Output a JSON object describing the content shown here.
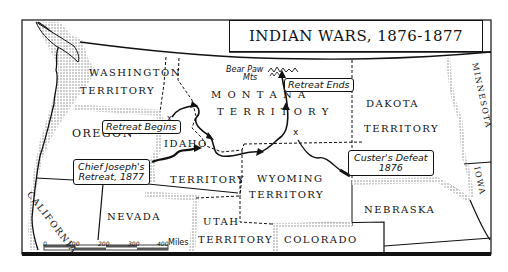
{
  "title": "INDIAN WARS, 1876-1877",
  "territories": [
    {
      "name": "WASHINGTON",
      "x": 89,
      "y": 71
    },
    {
      "name": "TERRITORY",
      "x": 80,
      "y": 89
    },
    {
      "name": "OREGON",
      "x": 72,
      "y": 131
    },
    {
      "name": "IDAHO",
      "x": 164,
      "y": 141
    },
    {
      "name": "TERRITORY",
      "x": 170,
      "y": 176
    },
    {
      "name": "M O N T A N A",
      "x": 211,
      "y": 91
    },
    {
      "name": "T E R R I T O R Y",
      "x": 217,
      "y": 108
    },
    {
      "name": "DAKOTA",
      "x": 366,
      "y": 100
    },
    {
      "name": "TERRITORY",
      "x": 364,
      "y": 125
    },
    {
      "name": "WYOMING",
      "x": 257,
      "y": 174
    },
    {
      "name": "TERRITORY",
      "x": 249,
      "y": 191
    },
    {
      "name": "NEVADA",
      "x": 107,
      "y": 214
    },
    {
      "name": "UTAH",
      "x": 203,
      "y": 218
    },
    {
      "name": "TERRITORY",
      "x": 198,
      "y": 236
    },
    {
      "name": "COLORADO",
      "x": 284,
      "y": 237
    },
    {
      "name": "NEBRASKA",
      "x": 364,
      "y": 207
    }
  ],
  "rotated_labels": [
    {
      "name": "CALIFORNIA",
      "x": 36,
      "y": 178,
      "rotate": 52
    },
    {
      "name": "MINNESOTA",
      "x": 456,
      "y": 72,
      "rotate": 78
    },
    {
      "name": "IOWA",
      "x": 462,
      "y": 171,
      "rotate": 78
    }
  ],
  "callouts": {
    "retreat_begins": "Retreat Begins",
    "retreat_ends": "Retreat Ends",
    "chief_joseph_line1": "Chief Joseph's",
    "chief_joseph_line2": "Retreat, 1877",
    "custer_line1": "Custer's Defeat",
    "custer_line2": "1876"
  },
  "landmarks": {
    "bear_paw_line1": "Bear Paw",
    "bear_paw_line2": "Mts"
  },
  "scale_bar": {
    "ticks": [
      "0",
      "100",
      "200",
      "300",
      "400"
    ],
    "unit": "Miles"
  },
  "colors": {
    "ink": "#111111",
    "background": "#ffffff",
    "stipple": "#9a9a9a"
  }
}
